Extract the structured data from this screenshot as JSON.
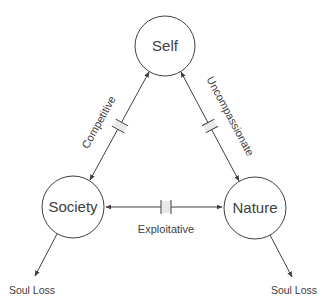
{
  "diagram": {
    "nodes": [
      {
        "id": "self",
        "label": "Self",
        "cx": 165,
        "cy": 46,
        "r": 30
      },
      {
        "id": "society",
        "label": "Society",
        "cx": 73,
        "cy": 207,
        "r": 31
      },
      {
        "id": "nature",
        "label": "Nature",
        "cx": 255,
        "cy": 208,
        "r": 31
      }
    ],
    "edges": [
      {
        "id": "self-society",
        "from": "self",
        "to": "society",
        "label": "Competitive",
        "bidirectional": true,
        "broken": true
      },
      {
        "id": "self-nature",
        "from": "self",
        "to": "nature",
        "label": "Uncompassionate",
        "bidirectional": true,
        "broken": true
      },
      {
        "id": "society-nature",
        "from": "society",
        "to": "nature",
        "label": "Exploitative",
        "bidirectional": true,
        "broken": true
      }
    ],
    "outputs": [
      {
        "id": "society-soul-loss",
        "from": "society",
        "label": "Soul Loss"
      },
      {
        "id": "nature-soul-loss",
        "from": "nature",
        "label": "Soul Loss"
      }
    ],
    "colors": {
      "stroke": "#404040",
      "text": "#404040",
      "break_fill": "#e8e8e8",
      "background": "#ffffff"
    }
  }
}
